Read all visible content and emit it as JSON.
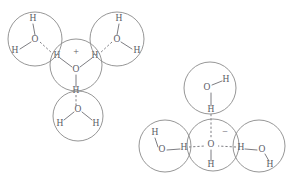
{
  "figure": {
    "background_color": "#ffffff",
    "stroke_color": "#8a8a8a",
    "text_color": "#5c5c66",
    "width": 287,
    "height": 187
  },
  "structures": [
    {
      "id": "hydronium-cluster",
      "name": "hydrated-hydronium-ion",
      "center_species": "H3O+",
      "charge_symbol": "+",
      "coordination": 3,
      "molecules": [
        {
          "id": "hydronium-core",
          "role": "central-ion",
          "circle": {
            "cx": 76,
            "cy": 65,
            "r": 26
          },
          "atoms": [
            {
              "element": "O",
              "x": 76,
              "y": 70
            },
            {
              "element": "H",
              "x": 57,
              "y": 56
            },
            {
              "element": "H",
              "x": 95,
              "y": 56
            },
            {
              "element": "H",
              "x": 76,
              "y": 91
            }
          ],
          "charge": {
            "symbol": "+",
            "x": 76,
            "y": 53
          }
        },
        {
          "id": "water-upper-left",
          "role": "shell-water",
          "circle": {
            "cx": 35,
            "cy": 39,
            "r": 27
          },
          "atoms": [
            {
              "element": "O",
              "x": 35,
              "y": 40
            },
            {
              "element": "H",
              "x": 33,
              "y": 19
            },
            {
              "element": "H",
              "x": 15,
              "y": 51
            }
          ]
        },
        {
          "id": "water-upper-right",
          "role": "shell-water",
          "circle": {
            "cx": 117,
            "cy": 39,
            "r": 27
          },
          "atoms": [
            {
              "element": "O",
              "x": 117,
              "y": 40
            },
            {
              "element": "H",
              "x": 119,
              "y": 19
            },
            {
              "element": "H",
              "x": 137,
              "y": 51
            }
          ]
        },
        {
          "id": "water-lower",
          "role": "shell-water",
          "circle": {
            "cx": 78,
            "cy": 116,
            "r": 25
          },
          "atoms": [
            {
              "element": "O",
              "x": 78,
              "y": 110
            },
            {
              "element": "H",
              "x": 60,
              "y": 124
            },
            {
              "element": "H",
              "x": 96,
              "y": 124
            }
          ]
        }
      ],
      "bonds": [
        {
          "type": "covalent",
          "x1": 72,
          "y1": 67,
          "x2": 60,
          "y2": 58
        },
        {
          "type": "covalent",
          "x1": 80,
          "y1": 67,
          "x2": 92,
          "y2": 58
        },
        {
          "type": "covalent",
          "x1": 76,
          "y1": 75,
          "x2": 76,
          "y2": 87
        },
        {
          "type": "covalent",
          "x1": 35,
          "y1": 35,
          "x2": 33,
          "y2": 24
        },
        {
          "type": "covalent",
          "x1": 31,
          "y1": 42,
          "x2": 20,
          "y2": 49
        },
        {
          "type": "covalent",
          "x1": 117,
          "y1": 35,
          "x2": 119,
          "y2": 24
        },
        {
          "type": "covalent",
          "x1": 121,
          "y1": 42,
          "x2": 132,
          "y2": 49
        },
        {
          "type": "covalent",
          "x1": 74,
          "y1": 112,
          "x2": 64,
          "y2": 120
        },
        {
          "type": "covalent",
          "x1": 82,
          "y1": 112,
          "x2": 92,
          "y2": 120
        },
        {
          "type": "hydrogen",
          "x1": 40,
          "y1": 42,
          "x2": 53,
          "y2": 54
        },
        {
          "type": "hydrogen",
          "x1": 112,
          "y1": 42,
          "x2": 99,
          "y2": 54
        },
        {
          "type": "hydrogen",
          "x1": 76,
          "y1": 95,
          "x2": 76,
          "y2": 106
        }
      ]
    },
    {
      "id": "hydroxide-cluster",
      "name": "hydrated-hydroxide-ion",
      "center_species": "OH-",
      "charge_symbol": "−",
      "coordination": 3,
      "molecules": [
        {
          "id": "hydroxide-core",
          "role": "central-ion",
          "circle": {
            "cx": 213,
            "cy": 145,
            "r": 26
          },
          "atoms": [
            {
              "element": "O",
              "x": 211,
              "y": 145
            },
            {
              "element": "H",
              "x": 211,
              "y": 165
            }
          ],
          "charge": {
            "symbol": "−",
            "x": 225,
            "y": 133
          }
        },
        {
          "id": "water-top",
          "role": "shell-water",
          "circle": {
            "cx": 210,
            "cy": 88,
            "r": 26
          },
          "atoms": [
            {
              "element": "O",
              "x": 207,
              "y": 88
            },
            {
              "element": "H",
              "x": 226,
              "y": 80
            },
            {
              "element": "H",
              "x": 211,
              "y": 110
            }
          ]
        },
        {
          "id": "water-left",
          "role": "shell-water",
          "circle": {
            "cx": 165,
            "cy": 146,
            "r": 26
          },
          "atoms": [
            {
              "element": "O",
              "x": 162,
              "y": 150
            },
            {
              "element": "H",
              "x": 155,
              "y": 133
            },
            {
              "element": "H",
              "x": 184,
              "y": 148
            }
          ]
        },
        {
          "id": "water-right",
          "role": "shell-water",
          "circle": {
            "cx": 259,
            "cy": 146,
            "r": 26
          },
          "atoms": [
            {
              "element": "O",
              "x": 262,
              "y": 150
            },
            {
              "element": "H",
              "x": 241,
              "y": 148
            },
            {
              "element": "H",
              "x": 270,
              "y": 165
            }
          ]
        }
      ],
      "bonds": [
        {
          "type": "covalent",
          "x1": 211,
          "y1": 150,
          "x2": 211,
          "y2": 161
        },
        {
          "type": "covalent",
          "x1": 211,
          "y1": 93,
          "x2": 211,
          "y2": 106
        },
        {
          "type": "covalent",
          "x1": 212,
          "y1": 85,
          "x2": 222,
          "y2": 81
        },
        {
          "type": "covalent",
          "x1": 158,
          "y1": 147,
          "x2": 155,
          "y2": 138
        },
        {
          "type": "covalent",
          "x1": 167,
          "y1": 150,
          "x2": 180,
          "y2": 149
        },
        {
          "type": "covalent",
          "x1": 257,
          "y1": 150,
          "x2": 245,
          "y2": 149
        },
        {
          "type": "covalent",
          "x1": 265,
          "y1": 154,
          "x2": 269,
          "y2": 161
        },
        {
          "type": "hydrogen",
          "x1": 211,
          "y1": 114,
          "x2": 211,
          "y2": 139
        },
        {
          "type": "hydrogen",
          "x1": 189,
          "y1": 147,
          "x2": 205,
          "y2": 146
        },
        {
          "type": "hydrogen",
          "x1": 236,
          "y1": 147,
          "x2": 218,
          "y2": 146
        }
      ]
    }
  ]
}
